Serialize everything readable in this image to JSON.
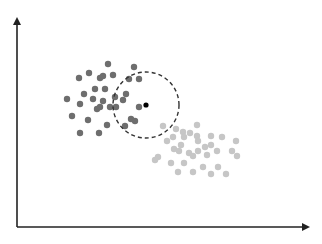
{
  "chart_data": {
    "type": "scatter",
    "title": "",
    "xlabel": "",
    "ylabel": "",
    "grid": false,
    "legend": null,
    "axes": {
      "origin": [
        17,
        227
      ],
      "x_end": [
        312,
        227
      ],
      "y_end": [
        17,
        15
      ],
      "color": "#222222"
    },
    "series": [
      {
        "name": "class-a",
        "color": "#6e6e6e",
        "radius": 3.2,
        "points": [
          [
            108,
            64
          ],
          [
            134,
            67
          ],
          [
            79,
            78
          ],
          [
            89,
            73
          ],
          [
            100,
            78
          ],
          [
            103,
            76
          ],
          [
            113,
            75
          ],
          [
            129,
            79
          ],
          [
            139,
            79
          ],
          [
            84,
            94
          ],
          [
            95,
            89
          ],
          [
            105,
            89
          ],
          [
            67,
            99
          ],
          [
            93,
            99
          ],
          [
            103,
            101
          ],
          [
            80,
            104
          ],
          [
            97,
            109
          ],
          [
            100,
            107
          ],
          [
            110,
            107
          ],
          [
            116,
            107
          ],
          [
            115,
            97
          ],
          [
            126,
            94
          ],
          [
            123,
            100
          ],
          [
            139,
            107
          ],
          [
            72,
            116
          ],
          [
            88,
            120
          ],
          [
            107,
            125
          ],
          [
            131,
            119
          ],
          [
            135,
            121
          ],
          [
            125,
            126
          ],
          [
            80,
            133
          ],
          [
            99,
            133
          ]
        ]
      },
      {
        "name": "class-b",
        "color": "#c6c6c6",
        "radius": 3.2,
        "points": [
          [
            163,
            126
          ],
          [
            197,
            125
          ],
          [
            176,
            129
          ],
          [
            183,
            132
          ],
          [
            190,
            133
          ],
          [
            173,
            137
          ],
          [
            184,
            137
          ],
          [
            197,
            136
          ],
          [
            211,
            136
          ],
          [
            222,
            137
          ],
          [
            167,
            141
          ],
          [
            181,
            145
          ],
          [
            198,
            141
          ],
          [
            211,
            145
          ],
          [
            205,
            147
          ],
          [
            236,
            141
          ],
          [
            174,
            149
          ],
          [
            179,
            151
          ],
          [
            189,
            153
          ],
          [
            198,
            151
          ],
          [
            217,
            151
          ],
          [
            232,
            151
          ],
          [
            193,
            156
          ],
          [
            207,
            155
          ],
          [
            237,
            156
          ],
          [
            158,
            157
          ],
          [
            155,
            160
          ],
          [
            171,
            163
          ],
          [
            184,
            163
          ],
          [
            203,
            167
          ],
          [
            218,
            167
          ],
          [
            178,
            172
          ],
          [
            193,
            172
          ],
          [
            211,
            174
          ],
          [
            226,
            174
          ]
        ]
      }
    ],
    "query_point": {
      "x": 146,
      "y": 105,
      "color": "#000000",
      "radius": 2.6
    },
    "neighborhood": {
      "cx": 146,
      "cy": 105,
      "r": 33,
      "style": "dashed",
      "color": "#333333"
    }
  }
}
